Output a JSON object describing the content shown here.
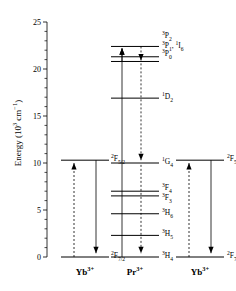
{
  "figure": {
    "type": "energy-level-diagram",
    "axis": {
      "ylabel_prefix": "Energy (10",
      "ylabel_sup": "3",
      "ylabel_mid": " cm",
      "ylabel_sup2": "−1",
      "ylabel_suffix": ")",
      "ylabel_plain": "Energy (10³ cm⁻¹)",
      "ymin": 0,
      "ymax": 25,
      "major_ticks": [
        "0",
        "5",
        "10",
        "15",
        "20",
        "25"
      ],
      "major_tick_values": [
        0,
        5,
        10,
        15,
        20,
        25
      ],
      "minor_tick_step": 1,
      "grid": false
    },
    "columns": [
      {
        "id": "yb-left",
        "ion_base": "Yb",
        "ion_charge": "3+",
        "ion_plain": "Yb³⁺"
      },
      {
        "id": "pr",
        "ion_base": "Pr",
        "ion_charge": "3+",
        "ion_plain": "Pr³⁺"
      },
      {
        "id": "yb-right",
        "ion_base": "Yb",
        "ion_charge": "3+",
        "ion_plain": "Yb³⁺"
      }
    ],
    "levels_yb_left": [
      {
        "sup": "2",
        "term": "F",
        "sub": "5/2",
        "label": "²F₅/₂",
        "energy": 10.3
      },
      {
        "sup": "2",
        "term": "F",
        "sub": "7/2",
        "label": "²F₇/₂",
        "energy": 0.0
      }
    ],
    "levels_pr": [
      {
        "sup": "3",
        "term": "P",
        "sub": "2",
        "label": "³P₂",
        "energy": 22.4,
        "label_show": true
      },
      {
        "sup": "3",
        "term": "P",
        "sub": "1",
        "label": "³P₁, ¹I₆",
        "energy": 21.3,
        "label_show": true,
        "combo_sup": "1",
        "combo_term": "I",
        "combo_sub": "6"
      },
      {
        "sup": "3",
        "term": "P",
        "sub": "0",
        "label": "³P₀",
        "energy": 20.8,
        "label_show": true
      },
      {
        "sup": "1",
        "term": "D",
        "sub": "2",
        "label": "¹D₂",
        "energy": 16.9,
        "label_show": true
      },
      {
        "sup": "1",
        "term": "G",
        "sub": "4",
        "label": "¹G₄",
        "energy": 10.0,
        "label_show": true
      },
      {
        "sup": "3",
        "term": "F",
        "sub": "4",
        "label": "³F₄",
        "energy": 7.0,
        "label_show": true
      },
      {
        "sup": "3",
        "term": "F",
        "sub": "3",
        "label": "³F₃",
        "energy": 6.5,
        "label_show": true
      },
      {
        "sup": "3",
        "term": "H",
        "sub": "6",
        "label": "³H₆",
        "energy": 4.6,
        "label_show": true
      },
      {
        "sup": "3",
        "term": "H",
        "sub": "5",
        "label": "³H₅",
        "energy": 2.3,
        "label_show": true
      },
      {
        "sup": "3",
        "term": "H",
        "sub": "4",
        "label": "³H₄",
        "energy": 0.0,
        "label_show": true
      }
    ],
    "levels_yb_right": [
      {
        "sup": "2",
        "term": "F",
        "sub": "5/2",
        "label": "²F₅/₂",
        "energy": 10.3
      },
      {
        "sup": "2",
        "term": "F",
        "sub": "7/2",
        "label": "²F₇/₂",
        "energy": 0.0
      }
    ],
    "transitions": {
      "yb_left_absorption_dashed_up": {
        "from": 0.0,
        "to": 10.3,
        "style": "dashed",
        "direction": "up"
      },
      "yb_left_emission_solid_down": {
        "from": 10.3,
        "to": 0.0,
        "style": "solid",
        "direction": "down"
      },
      "pr_excitation_solid_up": {
        "from": 0.0,
        "to": 22.4,
        "style": "solid",
        "direction": "up"
      },
      "pr_relax_dashed_down": {
        "from": 22.4,
        "to": 0.0,
        "style": "dashed",
        "direction": "down"
      },
      "yb_right_absorption_dashed_up": {
        "from": 0.0,
        "to": 10.3,
        "style": "dashed",
        "direction": "up"
      },
      "yb_right_emission_solid_down": {
        "from": 10.3,
        "to": 0.0,
        "style": "solid",
        "direction": "down"
      }
    },
    "colors": {
      "line": "#000000",
      "background": "#ffffff",
      "text": "#000000"
    }
  }
}
